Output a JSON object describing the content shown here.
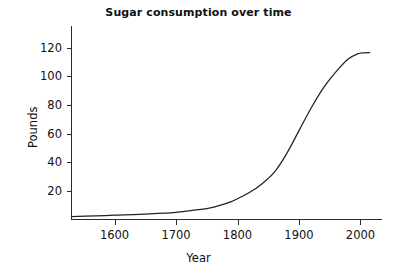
{
  "chart_data": {
    "type": "line",
    "title": "Sugar consumption over time",
    "xlabel": "Year",
    "ylabel": "Pounds",
    "xlim": [
      1530,
      2035
    ],
    "ylim": [
      0,
      135
    ],
    "xticks": [
      1600,
      1700,
      1800,
      1900,
      2000
    ],
    "xtick_labels": [
      "1600",
      "1700",
      "1800",
      "1900",
      "2000"
    ],
    "yticks": [
      20,
      40,
      60,
      80,
      100,
      120
    ],
    "ytick_labels": [
      "20",
      "40",
      "60",
      "80",
      "100",
      "120"
    ],
    "grid": false,
    "legend": false,
    "line_color": "#222222",
    "series": [
      {
        "name": "Sugar consumption",
        "x": [
          1530,
          1570,
          1600,
          1640,
          1670,
          1700,
          1730,
          1760,
          1790,
          1800,
          1820,
          1840,
          1860,
          1880,
          1900,
          1920,
          1940,
          1960,
          1980,
          1995,
          2005,
          2015
        ],
        "values": [
          2,
          2.5,
          3,
          3.5,
          4.2,
          5,
          6.5,
          8.5,
          12.5,
          14.5,
          19,
          25,
          33,
          46,
          62,
          78,
          92,
          103,
          112,
          115.5,
          116.3,
          116.5
        ]
      }
    ]
  },
  "axis": {
    "tick_count_x": 5,
    "tick_count_y": 6
  }
}
